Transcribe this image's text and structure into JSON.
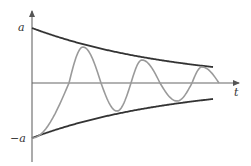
{
  "chart_data": {
    "type": "line",
    "title": "",
    "xlabel": "t",
    "ylabel": "",
    "y_ticks": [
      "a",
      "-a"
    ],
    "x_tick_labels": [],
    "grid": false,
    "legend": [],
    "axis": {
      "origin_px": [
        32,
        83
      ],
      "x_end_px": 240,
      "y_top_px": 10,
      "y_bottom_px": 162
    },
    "envelope": {
      "start_px": 32,
      "end_px": 213,
      "amp_start_px": 55,
      "amp_end_px": 16,
      "color": "#333333"
    },
    "series": [
      {
        "name": "upper-envelope",
        "description": "a·e^(−kt)",
        "color": "#333333"
      },
      {
        "name": "lower-envelope",
        "description": "−a·e^(−kt)",
        "color": "#333333"
      },
      {
        "name": "damped-oscillation",
        "color": "#999999",
        "keypoints_px": [
          [
            32,
            138
          ],
          [
            69,
            83
          ],
          [
            83,
            47
          ],
          [
            101,
            83
          ],
          [
            117,
            111
          ],
          [
            131,
            83
          ],
          [
            142,
            60
          ],
          [
            160,
            83
          ],
          [
            177,
            101
          ],
          [
            192,
            83
          ],
          [
            202,
            67
          ],
          [
            219,
            83
          ]
        ]
      }
    ],
    "labels": {
      "a": "a",
      "neg_a": "−a",
      "t": "t"
    },
    "colors": {
      "axis": "#666666",
      "envelope": "#333333",
      "wave": "#9a9a9a"
    }
  }
}
